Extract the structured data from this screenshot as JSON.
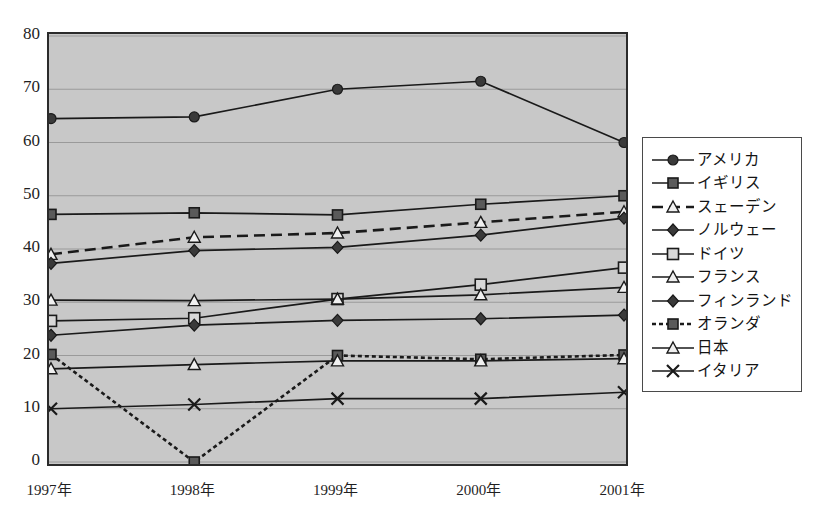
{
  "top_caption": "",
  "axes": {
    "y_ticks": [
      "80",
      "70",
      "60",
      "50",
      "40",
      "30",
      "20",
      "10",
      "0"
    ],
    "x_ticks": [
      "1997年",
      "1998年",
      "1999年",
      "2000年",
      "2001年"
    ]
  },
  "legend": {
    "items": [
      {
        "label": "アメリカ",
        "marker": "circle-filled",
        "line": "solid"
      },
      {
        "label": "イギリス",
        "marker": "square-filled",
        "line": "solid"
      },
      {
        "label": "スェーデン",
        "marker": "triangle-open",
        "line": "dashed"
      },
      {
        "label": "ノルウェー",
        "marker": "diamond-filled",
        "line": "solid"
      },
      {
        "label": "ドイツ",
        "marker": "square-open",
        "line": "solid"
      },
      {
        "label": "フランス",
        "marker": "triangle-open",
        "line": "solid"
      },
      {
        "label": "フィンランド",
        "marker": "diamond-filled",
        "line": "solid"
      },
      {
        "label": "オランダ",
        "marker": "square-filled",
        "line": "dotted"
      },
      {
        "label": "日本",
        "marker": "triangle-open",
        "line": "solid"
      },
      {
        "label": "イタリア",
        "marker": "cross",
        "line": "solid"
      }
    ]
  },
  "colors": {
    "plot_background": "#c8c8c8",
    "plot_border": "#2b2b2b",
    "gridline": "#9a9a9a",
    "series_line": "#1a1a1a",
    "marker_fill_dark": "#3a3a3a",
    "marker_fill_light": "#d8d8d8",
    "legend_border": "#4a4a4a",
    "legend_background": "#ffffff",
    "text": "#1a1a1a"
  },
  "chart_data": {
    "type": "line",
    "title": "",
    "xlabel": "",
    "ylabel": "",
    "x": [
      "1997年",
      "1998年",
      "1999年",
      "2000年",
      "2001年"
    ],
    "ylim": [
      0,
      80
    ],
    "ytick_step": 10,
    "grid": true,
    "legend_position": "right",
    "series": [
      {
        "name": "アメリカ",
        "marker": "circle-filled",
        "line": "solid",
        "values": [
          64.5,
          64.8,
          70.0,
          71.5,
          60.0
        ]
      },
      {
        "name": "イギリス",
        "marker": "square-filled",
        "line": "solid",
        "values": [
          46.5,
          46.8,
          46.4,
          48.4,
          50.0
        ]
      },
      {
        "name": "スェーデン",
        "marker": "triangle-open",
        "line": "dashed",
        "values": [
          39.0,
          42.2,
          43.0,
          45.0,
          47.0
        ]
      },
      {
        "name": "ノルウェー",
        "marker": "diamond-filled",
        "line": "solid",
        "values": [
          37.3,
          39.7,
          40.3,
          42.6,
          45.8
        ]
      },
      {
        "name": "ドイツ",
        "marker": "square-open",
        "line": "solid",
        "values": [
          26.5,
          27.0,
          30.6,
          33.3,
          36.5
        ]
      },
      {
        "name": "フランス",
        "marker": "triangle-open",
        "line": "solid",
        "values": [
          30.4,
          30.3,
          30.6,
          31.4,
          32.8
        ]
      },
      {
        "name": "フィンランド",
        "marker": "diamond-filled",
        "line": "solid",
        "values": [
          23.8,
          25.7,
          26.6,
          26.9,
          27.6
        ]
      },
      {
        "name": "オランダ",
        "marker": "square-filled",
        "line": "dotted",
        "values": [
          20.2,
          0.0,
          20.0,
          19.3,
          20.1
        ]
      },
      {
        "name": "日本",
        "marker": "triangle-open",
        "line": "solid",
        "values": [
          17.5,
          18.3,
          19.0,
          19.0,
          19.4
        ]
      },
      {
        "name": "イタリア",
        "marker": "cross",
        "line": "solid",
        "values": [
          10.0,
          10.8,
          11.9,
          11.9,
          13.1
        ]
      }
    ]
  }
}
